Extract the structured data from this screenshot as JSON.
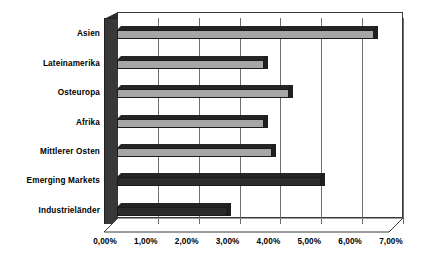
{
  "chart_data": {
    "type": "bar",
    "orientation": "horizontal",
    "title": "",
    "subtitle": "",
    "xlabel": "",
    "ylabel": "",
    "categories": [
      "Asien",
      "Lateinamerika",
      "Osteuropa",
      "Afrika",
      "Mittlerer Osten",
      "Emerging Markets",
      "Industrieländer"
    ],
    "values": [
      6.3,
      3.6,
      4.2,
      3.6,
      3.8,
      5.0,
      2.7
    ],
    "value_unit": "%",
    "value_format": "0,00%",
    "bar_styles": [
      "light",
      "light",
      "light",
      "light",
      "light",
      "dark",
      "dark"
    ],
    "xlim": [
      0,
      7
    ],
    "xticks": [
      0,
      1,
      2,
      3,
      4,
      5,
      6,
      7
    ],
    "xtick_labels": [
      "0,00%",
      "1,00%",
      "2,00%",
      "3,00%",
      "4,00%",
      "5,00%",
      "6,00%",
      "7,00%"
    ],
    "grid": true,
    "grid_axis": "x",
    "legend": false,
    "legend_position": "none",
    "style": "3d",
    "colors": {
      "bar_light": "#a6a6a6",
      "bar_dark": "#2b2b2b",
      "bar_edge": "#1a1a1a",
      "gridline": "#6e6e6e",
      "frame": "#3a3a3a",
      "side_wall": "#383838",
      "background": "#ffffff",
      "text": "#000000"
    }
  }
}
